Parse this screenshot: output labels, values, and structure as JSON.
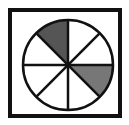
{
  "diagram": {
    "type": "fraction-circle",
    "total_sectors": 8,
    "shaded_sectors": 2,
    "frame": {
      "x": 10,
      "y": 10,
      "width": 110,
      "height": 106,
      "stroke": "#111111",
      "stroke_width": 4
    },
    "circle": {
      "cx": 68,
      "cy": 65,
      "r": 45,
      "stroke": "#111111",
      "stroke_width": 2.5
    },
    "sectors": [
      {
        "start_deg": 90,
        "end_deg": 135,
        "fill": "#555555"
      },
      {
        "start_deg": -45,
        "end_deg": 0,
        "fill": "#777777"
      }
    ],
    "line_color": "#111111"
  }
}
